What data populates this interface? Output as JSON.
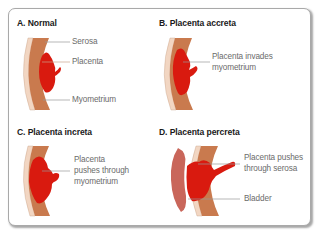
{
  "figure": {
    "panels": [
      {
        "title": "A. Normal",
        "labels": [
          "Serosa",
          "Placenta",
          "Myometrium"
        ]
      },
      {
        "title": "B. Placenta accreta",
        "labels": [
          "Placenta invades",
          "myometrium"
        ]
      },
      {
        "title": "C. Placenta increta",
        "labels": [
          "Placenta",
          "pushes through",
          "myometrium"
        ]
      },
      {
        "title": "D. Placenta percreta",
        "labels": [
          "Placenta pushes",
          "through serosa",
          "Bladder"
        ]
      }
    ],
    "colors": {
      "placenta": "#d91a0f",
      "myometrium": "#c97a4e",
      "serosa": "#f2d6c2",
      "bladder": "#c9665a",
      "leader_line": "#9a9a9a",
      "frame_border": "#a9a9a9"
    }
  }
}
